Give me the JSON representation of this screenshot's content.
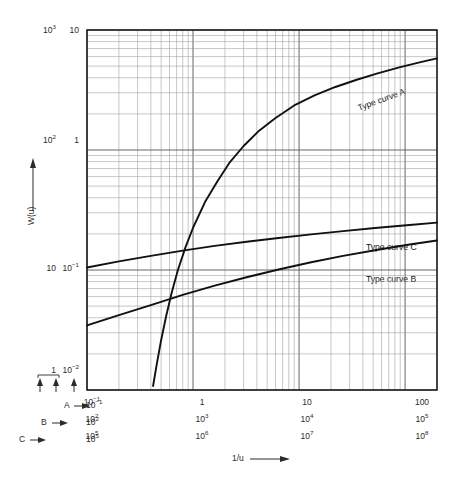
{
  "chart_data": {
    "type": "line",
    "title": "",
    "xlabel": "1/u",
    "ylabel": "W(u)",
    "xscale": "log",
    "yscale": "log",
    "grid": true,
    "legend_position": "inline-curve-labels",
    "xlim": [
      0.1,
      200
    ],
    "ylim": [
      0.01,
      10
    ],
    "axis_scales": {
      "x_rows": [
        {
          "name": "A",
          "ticks": [
            "10⁻¹",
            "1",
            "10",
            "100"
          ]
        },
        {
          "name": "B",
          "ticks": [
            "10²",
            "10³",
            "10⁴",
            "10⁵"
          ]
        },
        {
          "name": "C",
          "ticks": [
            "10⁵",
            "10⁶",
            "10⁷",
            "10⁸"
          ]
        }
      ],
      "y_outer": [
        "10³",
        "10²",
        "10",
        "1"
      ],
      "y_inner": [
        "10",
        "1",
        "10⁻¹",
        "10⁻²"
      ]
    },
    "series": [
      {
        "name": "Type curve A",
        "label": "Type curve A",
        "points": [
          [
            0.42,
            0.0108
          ],
          [
            0.45,
            0.0155
          ],
          [
            0.5,
            0.026
          ],
          [
            0.56,
            0.042
          ],
          [
            0.63,
            0.065
          ],
          [
            0.72,
            0.1
          ],
          [
            0.85,
            0.155
          ],
          [
            1.0,
            0.225
          ],
          [
            1.3,
            0.37
          ],
          [
            1.7,
            0.55
          ],
          [
            2.2,
            0.78
          ],
          [
            3.0,
            1.08
          ],
          [
            4.2,
            1.45
          ],
          [
            6.0,
            1.85
          ],
          [
            9.0,
            2.35
          ],
          [
            14.0,
            2.85
          ],
          [
            22.0,
            3.35
          ],
          [
            35.0,
            3.85
          ],
          [
            55.0,
            4.35
          ],
          [
            90.0,
            4.9
          ],
          [
            140.0,
            5.4
          ],
          [
            200.0,
            5.8
          ]
        ]
      },
      {
        "name": "Type curve B",
        "label": "Type curve B",
        "points": [
          [
            0.1,
            0.0345
          ],
          [
            0.2,
            0.042
          ],
          [
            0.4,
            0.051
          ],
          [
            0.8,
            0.062
          ],
          [
            1.6,
            0.074
          ],
          [
            3.2,
            0.087
          ],
          [
            6.4,
            0.101
          ],
          [
            13.0,
            0.116
          ],
          [
            26.0,
            0.131
          ],
          [
            52.0,
            0.146
          ],
          [
            110.0,
            0.163
          ],
          [
            200.0,
            0.176
          ]
        ]
      },
      {
        "name": "Type curve C",
        "label": "Type curve C",
        "points": [
          [
            0.1,
            0.105
          ],
          [
            0.2,
            0.118
          ],
          [
            0.4,
            0.131
          ],
          [
            0.8,
            0.145
          ],
          [
            1.6,
            0.159
          ],
          [
            3.2,
            0.172
          ],
          [
            6.4,
            0.185
          ],
          [
            13.0,
            0.198
          ],
          [
            26.0,
            0.211
          ],
          [
            52.0,
            0.224
          ],
          [
            110.0,
            0.237
          ],
          [
            200.0,
            0.248
          ]
        ]
      }
    ]
  },
  "axes": {
    "y_title": "W(u)",
    "x_title": "1/u",
    "y_labels_outer": [
      {
        "text": "10",
        "sup": "3"
      },
      {
        "text": "10",
        "sup": "2"
      },
      {
        "text": "10",
        "sup": ""
      },
      {
        "text": "1",
        "sup": ""
      }
    ],
    "y_labels_inner": [
      {
        "text": "10",
        "sup": ""
      },
      {
        "text": "1",
        "sup": ""
      },
      {
        "text": "10",
        "sup": "−1"
      },
      {
        "text": "10",
        "sup": "−2"
      }
    ],
    "x_row_a": [
      {
        "text": "10",
        "sup": "−1"
      },
      {
        "text": "1",
        "sup": ""
      },
      {
        "text": "10",
        "sup": ""
      },
      {
        "text": "100",
        "sup": ""
      }
    ],
    "x_row_b": [
      {
        "text": "10",
        "sup": "2"
      },
      {
        "text": "10",
        "sup": "3"
      },
      {
        "text": "10",
        "sup": "4"
      },
      {
        "text": "10",
        "sup": "5"
      }
    ],
    "x_row_c": [
      {
        "text": "10",
        "sup": "5"
      },
      {
        "text": "10",
        "sup": "6"
      },
      {
        "text": "10",
        "sup": "7"
      },
      {
        "text": "10",
        "sup": "8"
      }
    ]
  },
  "scale_key": {
    "rows": [
      {
        "name": "A",
        "value_text": "10",
        "value_sup": "−1"
      },
      {
        "name": "B",
        "value_text": "10",
        "value_sup": "2"
      },
      {
        "name": "C",
        "value_text": "10",
        "value_sup": "5"
      }
    ]
  },
  "curve_labels": {
    "a": "Type curve A",
    "b": "Type curve B",
    "c": "Type curve C"
  },
  "colors": {
    "curve": "#111111",
    "grid_major": "#555555",
    "grid_minor": "#9a9a9a",
    "frame": "#222222",
    "text": "#2b2b2b"
  }
}
